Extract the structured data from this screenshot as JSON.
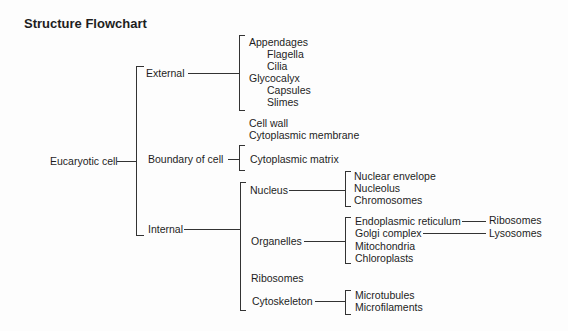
{
  "title": "Structure Flowchart",
  "root": "Eucaryotic cell",
  "level1": {
    "external": "External",
    "boundary": "Boundary of cell",
    "internal": "Internal"
  },
  "external": {
    "appendages": "Appendages",
    "flagella": "Flagella",
    "cilia": "Cilia",
    "glycocalyx": "Glycocalyx",
    "capsules": "Capsules",
    "slimes": "Slimes"
  },
  "boundary": {
    "cell_wall": "Cell wall",
    "membrane": "Cytoplasmic membrane"
  },
  "internal": {
    "matrix": "Cytoplasmic matrix",
    "nucleus": "Nucleus",
    "organelles": "Organelles",
    "ribosomes": "Ribosomes",
    "cytoskeleton": "Cytoskeleton"
  },
  "nucleus": {
    "envelope": "Nuclear envelope",
    "nucleolus": "Nucleolus",
    "chromosomes": "Chromosomes"
  },
  "organelles": {
    "er": "Endoplasmic reticulum",
    "golgi": "Golgi complex",
    "mitochondria": "Mitochondria",
    "chloroplasts": "Chloroplasts",
    "er_child": "Ribosomes",
    "golgi_child": "Lysosomes"
  },
  "cytoskeleton": {
    "microtubules": "Microtubules",
    "microfilaments": "Microfilaments"
  }
}
